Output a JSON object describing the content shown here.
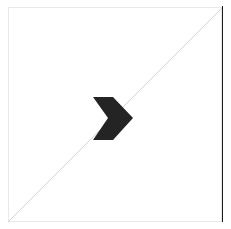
{
  "figure": {
    "title": "",
    "top_artifact_text": "",
    "canvas": {
      "width": 231,
      "height": 229,
      "background_color": "#ffffff"
    }
  },
  "frame": {
    "name": "plot-frame",
    "stroke_color": "#e9e9ea",
    "stroke_width": 1,
    "left": 8,
    "top": 7,
    "width": 214,
    "height": 215
  },
  "right_rule": {
    "name": "right-edge-rule",
    "color": "#1c1c1c",
    "width": 1,
    "x": 222,
    "top": 6,
    "height": 216
  },
  "diagonal": {
    "name": "diagonal-guide-line",
    "color": "#d2d2d4",
    "stroke_width": 1,
    "x1": 8,
    "y1": 222,
    "x2": 222,
    "y2": 8
  },
  "chevron": {
    "name": "chevron-right-marker",
    "fill_color": "#242424",
    "points": "93,97 113,97 133,118 113,140 93,140 108,118",
    "center_x": 113,
    "center_y": 118,
    "bbox": {
      "x": 93,
      "y": 97,
      "width": 40,
      "height": 43
    },
    "direction": "right"
  }
}
